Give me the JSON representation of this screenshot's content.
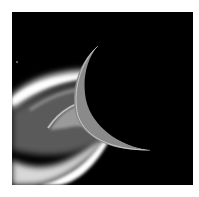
{
  "image": {
    "description": "Grayscale space image of a dark crescent-lit moon limb with bright plume/glow bands on the left",
    "background_color": "#000000",
    "page_color": "#ffffff"
  }
}
